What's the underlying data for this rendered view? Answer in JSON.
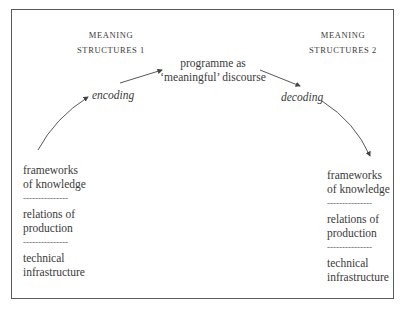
{
  "diagram": {
    "left_header": {
      "line1": "MEANING",
      "line2": "STRUCTURES 1"
    },
    "right_header": {
      "line1": "MEANING",
      "line2": "STRUCTURES 2"
    },
    "center": {
      "line1": "programme as",
      "line2": "‘meaningful’ discourse"
    },
    "encoding_label": "encoding",
    "decoding_label": "decoding",
    "left_stack": {
      "items": [
        {
          "line1": "frameworks",
          "line2": "of knowledge"
        },
        {
          "line1": "relations of",
          "line2": "production"
        },
        {
          "line1": "technical",
          "line2": "infrastructure"
        }
      ],
      "separator": "---------------"
    },
    "right_stack": {
      "items": [
        {
          "line1": "frameworks",
          "line2": "of knowledge"
        },
        {
          "line1": "relations of",
          "line2": "production"
        },
        {
          "line1": "technical",
          "line2": "infrastructure"
        }
      ],
      "separator": "---------------"
    },
    "colors": {
      "border": "#5a5a5a",
      "text": "#3a3a3a",
      "arrow": "#444444"
    }
  }
}
